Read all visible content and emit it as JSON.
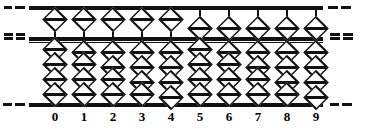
{
  "figure": {
    "name": "abacus-soroban-diagram",
    "colors": {
      "ink": "#111111",
      "paper": "#ffffff"
    },
    "geometry": {
      "width": 371,
      "height": 129,
      "frame_left": 29,
      "frame_right": 323,
      "bar_top_y": 6,
      "bar_mid_y": 37,
      "bar_bottom_y": 103,
      "bead_w": 26,
      "bead_h": 17,
      "heaven_up_y": 11,
      "heaven_down_y": 20,
      "earth_slot_h": 15,
      "earth_top_y": 44,
      "earth_bottom_y": 86
    },
    "edge_marks": {
      "description": "dashed rule continuations outside the frame",
      "left": [
        {
          "y": 6,
          "segments": [
            {
              "x": 4,
              "w": 8
            },
            {
              "x": 15,
              "w": 10
            }
          ]
        },
        {
          "y": 33,
          "segments": [
            {
              "x": 4,
              "w": 9
            },
            {
              "x": 16,
              "w": 9
            }
          ]
        },
        {
          "y": 37,
          "segments": [
            {
              "x": 4,
              "w": 9
            },
            {
              "x": 16,
              "w": 9
            }
          ]
        },
        {
          "y": 103,
          "segments": [
            {
              "x": 3,
              "w": 9
            },
            {
              "x": 15,
              "w": 10
            }
          ]
        }
      ],
      "right": [
        {
          "y": 6,
          "segments": [
            {
              "x": 328,
              "w": 10
            },
            {
              "x": 341,
              "w": 10
            }
          ]
        },
        {
          "y": 33,
          "segments": [
            {
              "x": 330,
              "w": 10
            },
            {
              "x": 343,
              "w": 10
            }
          ]
        },
        {
          "y": 37,
          "segments": [
            {
              "x": 330,
              "w": 10
            },
            {
              "x": 343,
              "w": 10
            }
          ]
        },
        {
          "y": 103,
          "segments": [
            {
              "x": 330,
              "w": 9
            },
            {
              "x": 342,
              "w": 10
            }
          ]
        }
      ]
    },
    "columns": [
      {
        "label": "0",
        "x": 55,
        "value": 0,
        "heaven_active": false,
        "earth_active": 0
      },
      {
        "label": "1",
        "x": 84,
        "value": 1,
        "heaven_active": false,
        "earth_active": 1
      },
      {
        "label": "2",
        "x": 113,
        "value": 2,
        "heaven_active": false,
        "earth_active": 2
      },
      {
        "label": "3",
        "x": 142,
        "value": 3,
        "heaven_active": false,
        "earth_active": 3
      },
      {
        "label": "4",
        "x": 171,
        "value": 4,
        "heaven_active": false,
        "earth_active": 4
      },
      {
        "label": "5",
        "x": 200,
        "value": 5,
        "heaven_active": true,
        "earth_active": 0
      },
      {
        "label": "6",
        "x": 229,
        "value": 6,
        "heaven_active": true,
        "earth_active": 1
      },
      {
        "label": "7",
        "x": 258,
        "value": 7,
        "heaven_active": true,
        "earth_active": 2
      },
      {
        "label": "8",
        "x": 287,
        "value": 8,
        "heaven_active": true,
        "earth_active": 3
      },
      {
        "label": "9",
        "x": 316,
        "value": 9,
        "heaven_active": true,
        "earth_active": 4
      }
    ]
  }
}
